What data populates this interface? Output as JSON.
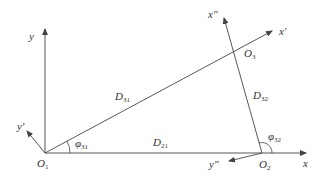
{
  "diagram": {
    "type": "coordinate-geometry",
    "colors": {
      "line": "#444444",
      "text": "#333333",
      "background": "#ffffff"
    },
    "points": {
      "O1": {
        "label": "O",
        "sub": "1"
      },
      "O2": {
        "label": "O",
        "sub": "2"
      },
      "O3": {
        "label": "O",
        "sub": "3"
      }
    },
    "axes": {
      "x": {
        "label": "x"
      },
      "y": {
        "label": "y"
      },
      "x_prime": {
        "label": "x′"
      },
      "y_prime": {
        "label": "y′"
      },
      "x_double_prime": {
        "label": "x″"
      },
      "y_double_prime": {
        "label": "y″"
      }
    },
    "distances": {
      "D31": {
        "label": "D",
        "sub": "31"
      },
      "D21": {
        "label": "D",
        "sub": "21"
      },
      "D32": {
        "label": "D",
        "sub": "32"
      }
    },
    "angles": {
      "phi31": {
        "label": "φ",
        "sub": "31"
      },
      "phi32": {
        "label": "φ",
        "sub": "32"
      }
    }
  }
}
